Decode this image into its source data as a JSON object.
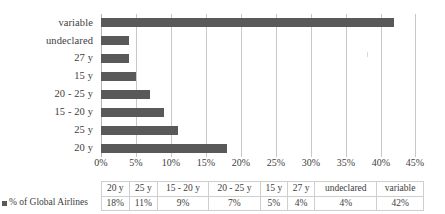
{
  "chart_data": {
    "type": "bar",
    "orientation": "horizontal",
    "title": "",
    "subtitle": "",
    "xlabel": "",
    "ylabel": "",
    "categories": [
      "20 y",
      "25 y",
      "15 - 20 y",
      "20 - 25 y",
      "15 y",
      "27 y",
      "undeclared",
      "variable"
    ],
    "plot_order_top_to_bottom": [
      "variable",
      "undeclared",
      "27 y",
      "15 y",
      "20 - 25 y",
      "15 - 20 y",
      "25 y",
      "20 y"
    ],
    "series": [
      {
        "name": "% of Global Airlines",
        "values": [
          18,
          11,
          9,
          7,
          5,
          4,
          4,
          42
        ],
        "value_labels": [
          "18%",
          "11%",
          "9%",
          "7%",
          "5%",
          "4%",
          "4%",
          "42%"
        ],
        "color": "#595959"
      }
    ],
    "xlim": [
      0,
      45
    ],
    "xticks": [
      0,
      5,
      10,
      15,
      20,
      25,
      30,
      35,
      40,
      45
    ],
    "xtick_labels": [
      "0%",
      "5%",
      "10%",
      "15%",
      "20%",
      "25%",
      "30%",
      "35%",
      "40%",
      "45%"
    ],
    "grid": "vertical",
    "legend_position": "data-table-row"
  },
  "plot": {
    "bars_top_to_bottom": [
      {
        "label": "variable",
        "value": 42,
        "value_label": "42%"
      },
      {
        "label": "undeclared",
        "value": 4,
        "value_label": "4%"
      },
      {
        "label": "27 y",
        "value": 4,
        "value_label": "4%"
      },
      {
        "label": "15 y",
        "value": 5,
        "value_label": "5%"
      },
      {
        "label": "20 - 25 y",
        "value": 7,
        "value_label": "7%"
      },
      {
        "label": "15 - 20 y",
        "value": 9,
        "value_label": "9%"
      },
      {
        "label": "25 y",
        "value": 11,
        "value_label": "11%"
      },
      {
        "label": "20 y",
        "value": 18,
        "value_label": "18%"
      }
    ],
    "xtick_labels": [
      "0%",
      "5%",
      "10%",
      "15%",
      "20%",
      "25%",
      "30%",
      "35%",
      "40%",
      "45%"
    ]
  },
  "table": {
    "series_label": "% of Global Airlines",
    "headers": [
      "20 y",
      "25 y",
      "15 - 20 y",
      "20 - 25 y",
      "15 y",
      "27 y",
      "undeclared",
      "variable"
    ],
    "values": [
      "18%",
      "11%",
      "9%",
      "7%",
      "5%",
      "4%",
      "4%",
      "42%"
    ]
  },
  "colors": {
    "bar": "#595959",
    "gridline": "#c8c8c8",
    "axis": "#b4b4b4",
    "table_border": "#cfcfcf",
    "text": "#3d3d3d",
    "background": "#ffffff"
  }
}
